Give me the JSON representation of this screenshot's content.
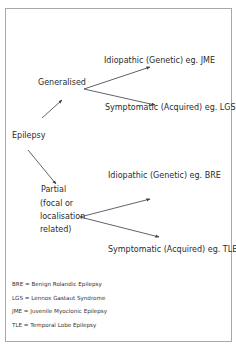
{
  "diagram": {
    "root": "Epilepsy",
    "branches": [
      {
        "label": "Generalised",
        "children": [
          "Idiopathic (Genetic) eg. JME",
          "Symptomatic (Acquired) eg. LGS"
        ]
      },
      {
        "label_lines": [
          "Partial",
          "(focal or",
          "localisation",
          "related)"
        ],
        "children": [
          "Idiopathic (Genetic) eg. BRE",
          "Symptomatic (Acquired) eg. TLE"
        ]
      }
    ]
  },
  "legend": [
    "BRE = Benign Rolandic Epilepsy",
    "LGS = Lennox Gastaut Syndrome",
    "JME = Juvenile Myoclonic Epilepsy",
    "TLE = Temporal Lobe Epilepsy"
  ],
  "colors": {
    "text": "#2b2b2b",
    "arrow": "#3a3a4a",
    "frame": "#a8a8a8"
  }
}
